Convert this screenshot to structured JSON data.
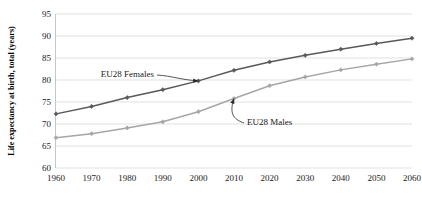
{
  "chart_data": {
    "type": "line",
    "title": "",
    "xlabel": "",
    "ylabel": "Life expectancy at birth, total (years)",
    "x": [
      1960,
      1970,
      1980,
      1990,
      2000,
      2010,
      2020,
      2030,
      2040,
      2050,
      2060
    ],
    "xtick_labels": [
      "1960",
      "1970",
      "1980",
      "1990",
      "2000",
      "2010",
      "2020",
      "2030",
      "2040",
      "2050",
      "2060"
    ],
    "ytick_labels": [
      "60",
      "65",
      "70",
      "75",
      "80",
      "85",
      "90",
      "95"
    ],
    "yticks": [
      60,
      65,
      70,
      75,
      80,
      85,
      90,
      95
    ],
    "ylim": [
      60,
      95
    ],
    "xlim": [
      1960,
      2060
    ],
    "grid": true,
    "legend_position": "inline-annotations",
    "series": [
      {
        "name": "EU28 Females",
        "color": "#595959",
        "marker": "diamond",
        "values": [
          72.3,
          74.0,
          76.0,
          77.8,
          79.8,
          82.2,
          84.1,
          85.6,
          87.0,
          88.3,
          89.5
        ]
      },
      {
        "name": "EU28 Males",
        "color": "#a6a6a6",
        "marker": "diamond",
        "values": [
          66.9,
          67.8,
          69.1,
          70.5,
          72.8,
          75.8,
          78.7,
          80.7,
          82.3,
          83.6,
          84.8
        ]
      }
    ],
    "annotations": [
      {
        "text": "EU28 Females",
        "points_to_year": 2000,
        "points_to_value": 79.8
      },
      {
        "text": "EU28 Males",
        "points_to_year": 2010,
        "points_to_value": 75.8
      }
    ]
  },
  "colors": {
    "females_line": "#595959",
    "males_line": "#a6a6a6",
    "gridline": "#d9d9d9",
    "axis": "#bfbfbf",
    "text": "#1a1a1a",
    "background": "#ffffff"
  }
}
